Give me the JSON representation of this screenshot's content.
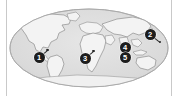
{
  "figure": {
    "type": "world-map-thumbnail",
    "projection_label": "oval world projection",
    "width": 179,
    "height": 96
  },
  "colors": {
    "page_background": "#ffffff",
    "ocean_fill": "#dcdcdc",
    "ocean_edge": "#b8b8b8",
    "land_fill": "#f2f2f2",
    "land_stroke": "#8e8e8e",
    "marker_fill": "#1d1d1d",
    "marker_text": "#ffffff",
    "leader_line": "#2a2a2a",
    "edge_rule": "#c9c9c9"
  },
  "map": {
    "ocean_name": "ocean",
    "land_name": "landmasses",
    "antarctica_name": "antarctica"
  },
  "markers": [
    {
      "id": "marker-1",
      "label": "1",
      "region": "northwestern South America",
      "x": 32,
      "y": 57,
      "leader": {
        "angle_deg": -40,
        "length": 11
      }
    },
    {
      "id": "marker-2",
      "label": "2",
      "region": "western Pacific / East Asia",
      "x": 143,
      "y": 34,
      "leader": {
        "angle_deg": 38,
        "length": 13
      }
    },
    {
      "id": "marker-3",
      "label": "3",
      "region": "western Africa",
      "x": 78,
      "y": 58,
      "leader": {
        "angle_deg": -40,
        "length": 11
      }
    },
    {
      "id": "marker-4",
      "label": "4",
      "region": "South Asia",
      "x": 118,
      "y": 47,
      "leader": null
    },
    {
      "id": "marker-5",
      "label": "5",
      "region": "Indian Ocean / South Asia",
      "x": 118,
      "y": 57,
      "leader": null
    }
  ]
}
